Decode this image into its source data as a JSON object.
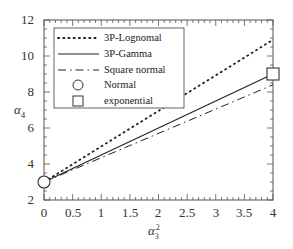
{
  "chart_data": {
    "type": "line",
    "title": "",
    "xlabel": "α3²",
    "ylabel": "α4",
    "xlim": [
      0,
      4
    ],
    "ylim": [
      2,
      12
    ],
    "x_ticks": [
      "0",
      "0.5",
      "1",
      "1.5",
      "2",
      "2.5",
      "3",
      "3.5",
      "4"
    ],
    "y_ticks": [
      "2",
      "4",
      "6",
      "8",
      "10",
      "12"
    ],
    "grid": false,
    "legend_position": "upper left",
    "series": [
      {
        "name": "3P-Lognomal",
        "style": "dotted",
        "x": [
          0,
          4
        ],
        "y": [
          3,
          10.9
        ]
      },
      {
        "name": "3P-Gamma",
        "style": "solid",
        "x": [
          0,
          4
        ],
        "y": [
          3,
          9
        ]
      },
      {
        "name": "Square normal",
        "style": "dash-dot",
        "x": [
          0,
          4
        ],
        "y": [
          3,
          8.4
        ]
      },
      {
        "name": "Normal",
        "style": "marker-circle",
        "x": [
          0
        ],
        "y": [
          3
        ]
      },
      {
        "name": "exponential",
        "style": "marker-square",
        "x": [
          4
        ],
        "y": [
          9
        ]
      }
    ]
  },
  "axes": {
    "xlabel_base": "α",
    "xlabel_sub": "3",
    "xlabel_sup": "2",
    "ylabel_base": "α",
    "ylabel_sub": "4"
  },
  "legend": [
    "3P-Lognomal",
    "3P-Gamma",
    "Square normal",
    "Normal",
    "exponential"
  ]
}
